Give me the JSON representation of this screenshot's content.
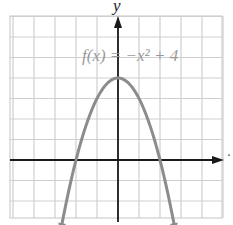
{
  "chart_data": {
    "type": "line",
    "title": "",
    "function_label": "f(x) = −x² + 4",
    "xlabel": "x",
    "ylabel": "y",
    "xlim": [
      -5,
      5
    ],
    "ylim": [
      -3,
      7
    ],
    "grid": true,
    "grid_step": 1,
    "series": [
      {
        "name": "f(x) = -x^2 + 4",
        "x": [
          -2.8,
          -2.5,
          -2,
          -1.5,
          -1,
          -0.5,
          0,
          0.5,
          1,
          1.5,
          2,
          2.5,
          2.8
        ],
        "y": [
          -3.84,
          -2.25,
          0,
          1.75,
          3,
          3.75,
          4,
          3.75,
          3,
          1.75,
          0,
          -2.25,
          -3.84
        ],
        "color": "#8c8c8c",
        "arrows_at_ends": true
      }
    ],
    "key_points": {
      "vertex": [
        0,
        4
      ],
      "x_intercepts": [
        [
          -2,
          0
        ],
        [
          2,
          0
        ]
      ]
    }
  },
  "labels": {
    "y_axis": "y",
    "x_axis": "·",
    "function": "f(x) = −x² + 4"
  },
  "colors": {
    "grid": "#cfcfcf",
    "axis": "#1a1a1a",
    "curve": "#8c8c8c",
    "label": "#9a9a9a"
  }
}
